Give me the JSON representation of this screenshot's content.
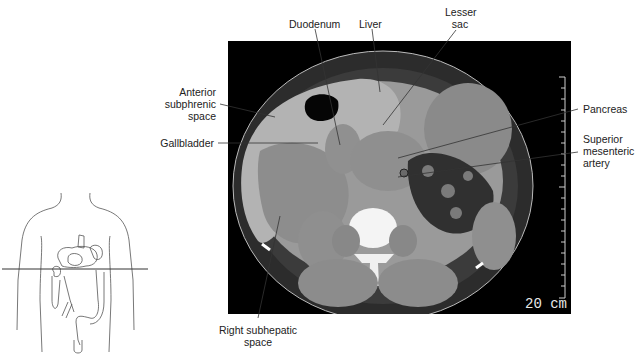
{
  "figure": {
    "labels": {
      "duodenum": "Duodenum",
      "liver": "Liver",
      "lesser_sac_line1": "Lesser",
      "lesser_sac_line2": "sac",
      "anterior_line1": "Anterior",
      "anterior_line2": "subphrenic",
      "anterior_line3": "space",
      "gallbladder": "Gallbladder",
      "pancreas": "Pancreas",
      "sma_line1": "Superior",
      "sma_line2": "mesenteric",
      "sma_line3": "artery",
      "rsh_line1": "Right subhepatic",
      "rsh_line2": "space"
    },
    "scale_bar": "20 cm",
    "colors": {
      "ct_background": "#000000",
      "label_text": "#222222",
      "leader_line": "#333333"
    }
  }
}
